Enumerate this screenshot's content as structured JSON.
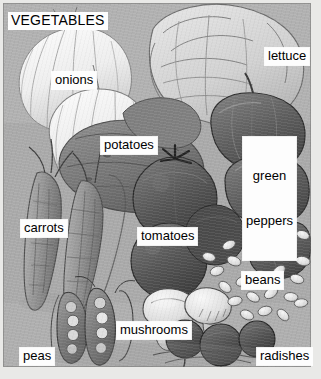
{
  "figure": {
    "title": "VEGETABLES",
    "kind": "labeled pencil illustration",
    "palette": {
      "background": "#e9e9e7",
      "plate_base": "#a8a9a6",
      "label_background": "#fdfdfd",
      "label_text": "#000000",
      "ink_dark": "#3d3d3c",
      "ink_mid": "#6e6f6c",
      "highlight": "#f2f2ef"
    }
  },
  "labels": [
    {
      "id": "vegetables",
      "text": "VEGETABLES",
      "x": 8,
      "y": 12,
      "lines": [
        "VEGETABLES"
      ]
    },
    {
      "id": "onions",
      "text": "onions",
      "x": 52,
      "y": 72,
      "lines": [
        "onions"
      ]
    },
    {
      "id": "lettuce",
      "text": "lettuce",
      "x": 265,
      "y": 48,
      "lines": [
        "lettuce"
      ]
    },
    {
      "id": "potatoes",
      "text": "potatoes",
      "x": 101,
      "y": 137,
      "lines": [
        "potatoes"
      ]
    },
    {
      "id": "green-peppers",
      "text": "green peppers",
      "x": 243,
      "y": 137,
      "lines": [
        "green",
        "peppers"
      ]
    },
    {
      "id": "carrots",
      "text": "carrots",
      "x": 21,
      "y": 220,
      "lines": [
        "carrots"
      ]
    },
    {
      "id": "tomatoes",
      "text": "tomatoes",
      "x": 138,
      "y": 228,
      "lines": [
        "tomatoes"
      ]
    },
    {
      "id": "beans",
      "text": "beans",
      "x": 242,
      "y": 272,
      "lines": [
        "beans"
      ]
    },
    {
      "id": "mushrooms",
      "text": "mushrooms",
      "x": 117,
      "y": 322,
      "lines": [
        "mushrooms"
      ]
    },
    {
      "id": "peas",
      "text": "peas",
      "x": 20,
      "y": 348,
      "lines": [
        "peas"
      ]
    },
    {
      "id": "radishes",
      "text": "radishes",
      "x": 257,
      "y": 348,
      "lines": [
        "radishes"
      ]
    }
  ]
}
